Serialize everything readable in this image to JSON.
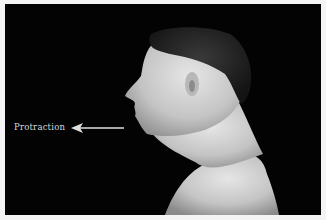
{
  "figure": {
    "annotation": {
      "label": "Protraction",
      "arrow_direction": "left"
    },
    "colors": {
      "background": "#030303",
      "frame": "#f4f4f4",
      "annotation": "#e0e0e0"
    }
  }
}
